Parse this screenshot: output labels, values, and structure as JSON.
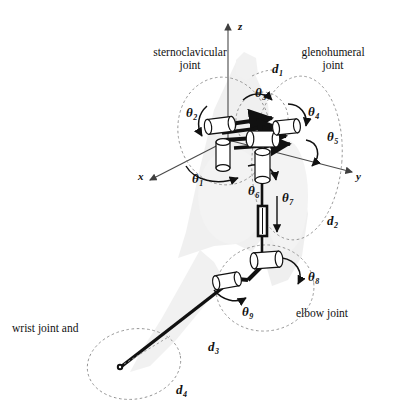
{
  "figure": {
    "type": "kinematic-chain-diagram",
    "background": "faint grey human torso and arm silhouette"
  },
  "axes": {
    "z": {
      "label": "z",
      "x": 238,
      "y": 27,
      "direction": "up"
    },
    "y": {
      "label": "y",
      "x": 359,
      "y": 176,
      "direction": "right-down"
    },
    "x": {
      "label": "x",
      "x": 141,
      "y": 176,
      "direction": "left-down"
    },
    "origin": {
      "x": 228,
      "y": 140
    }
  },
  "joint_groups": [
    {
      "name": "sternoclavicular-joint",
      "label": "sternoclavicular\njoint",
      "line1": "sternoclavicular",
      "line2": "joint",
      "label_x": 143,
      "label_y": 50,
      "ellipse": {
        "cx": 224,
        "cy": 131,
        "rx": 46,
        "ry": 54,
        "rotate": -8
      }
    },
    {
      "name": "glenohumeral-joint",
      "label": "glenohumeral\njoint",
      "line1": "glenohumeral",
      "line2": "joint",
      "label_x": 290,
      "label_y": 50,
      "ellipse": {
        "cx": 297,
        "cy": 158,
        "rx": 45,
        "ry": 82,
        "rotate": 4
      }
    },
    {
      "name": "elbow-joint",
      "label": "elbow joint",
      "line1": "elbow joint",
      "line2": "",
      "label_x": 301,
      "label_y": 313,
      "ellipse": {
        "cx": 265,
        "cy": 288,
        "rx": 49,
        "ry": 43,
        "rotate": -6
      }
    },
    {
      "name": "wrist-joint",
      "label": "wrist joint and",
      "line1": "wrist joint and",
      "line2": "",
      "label_x": 12,
      "label_y": 329,
      "ellipse": {
        "cx": 134,
        "cy": 364,
        "rx": 47,
        "ry": 35,
        "rotate": -10
      }
    }
  ],
  "angle_labels": [
    {
      "name": "theta-1",
      "glyph": "θ",
      "sub": "1",
      "x": 196,
      "y": 179
    },
    {
      "name": "theta-2",
      "glyph": "θ",
      "sub": "2",
      "x": 191,
      "y": 113
    },
    {
      "name": "theta-3",
      "glyph": "θ",
      "sub": "3",
      "x": 259,
      "y": 93
    },
    {
      "name": "theta-4",
      "glyph": "θ",
      "sub": "4",
      "x": 312,
      "y": 112
    },
    {
      "name": "theta-5",
      "glyph": "θ",
      "sub": "5",
      "x": 330,
      "y": 137
    },
    {
      "name": "theta-6",
      "glyph": "θ",
      "sub": "6",
      "x": 252,
      "y": 191
    },
    {
      "name": "theta-7",
      "glyph": "θ",
      "sub": "7",
      "x": 285,
      "y": 198
    },
    {
      "name": "theta-8",
      "glyph": "θ",
      "sub": "8",
      "x": 311,
      "y": 277
    },
    {
      "name": "theta-9",
      "glyph": "θ",
      "sub": "9",
      "x": 246,
      "y": 312
    }
  ],
  "length_labels": [
    {
      "name": "d-1",
      "glyph": "d",
      "sub": "1",
      "x": 275,
      "y": 69
    },
    {
      "name": "d-2",
      "glyph": "d",
      "sub": "2",
      "x": 330,
      "y": 221
    },
    {
      "name": "d-3",
      "glyph": "d",
      "sub": "3",
      "x": 212,
      "y": 347
    },
    {
      "name": "d-4",
      "glyph": "d",
      "sub": "4",
      "x": 180,
      "y": 390
    }
  ],
  "links": [
    {
      "name": "clavicle-link",
      "from": [
        224,
        132
      ],
      "to": [
        271,
        124
      ]
    },
    {
      "name": "scapula-link",
      "from": [
        232,
        142
      ],
      "to": [
        286,
        136
      ]
    },
    {
      "name": "humerus-link",
      "from": [
        262,
        152
      ],
      "to": [
        262,
        252
      ]
    },
    {
      "name": "forearm-link",
      "from": [
        262,
        268
      ],
      "to": [
        228,
        283
      ]
    },
    {
      "name": "hand-link",
      "from": [
        228,
        283
      ],
      "to": [
        120,
        366
      ]
    }
  ],
  "colors": {
    "ink": "#111111",
    "dashed": "#8c8c8c",
    "silhouette": "#d9d9d9",
    "cylinder_fill": "#ffffff",
    "axis": "#4a4a4a"
  }
}
